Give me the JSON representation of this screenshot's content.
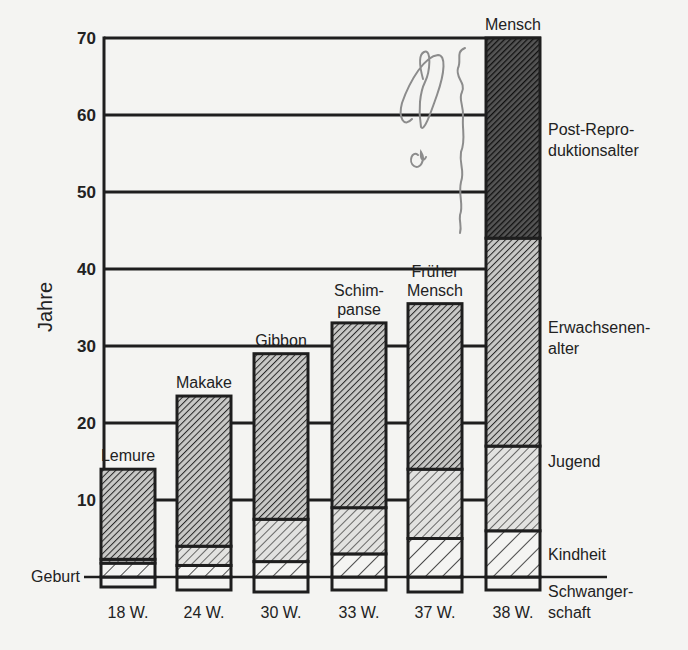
{
  "chart_data": {
    "type": "bar",
    "stacked": true,
    "title": "",
    "xlabel": "",
    "ylabel": "Jahre",
    "ylim": [
      0,
      70
    ],
    "yticks": [
      10,
      20,
      30,
      40,
      50,
      60,
      70
    ],
    "baseline_label": "Geburt",
    "grid": true,
    "categories": [
      "Lemure",
      "Makake",
      "Gibbon",
      "Schimpanse",
      "Früher Mensch",
      "Mensch"
    ],
    "category_labels": [
      [
        "Lemure"
      ],
      [
        "Makake"
      ],
      [
        "Gibbon"
      ],
      [
        "Schim-",
        "panse"
      ],
      [
        "Früher",
        "Mensch"
      ],
      [
        "Mensch"
      ]
    ],
    "gestation_labels": [
      "18 W.",
      "24 W.",
      "30 W.",
      "33 W.",
      "37 W.",
      "38 W."
    ],
    "gestation_weeks": [
      18,
      24,
      30,
      33,
      37,
      38
    ],
    "series": [
      {
        "name": "Schwangerschaft",
        "label_lines": [
          "Schwanger-",
          "schaft"
        ],
        "values_weeks": [
          18,
          24,
          30,
          33,
          37,
          38
        ],
        "pattern": "none"
      },
      {
        "name": "Kindheit",
        "label_lines": [
          "Kindheit"
        ],
        "values": [
          1.8,
          1.5,
          2,
          3,
          5,
          6
        ],
        "pattern": "sparse"
      },
      {
        "name": "Jugend",
        "label_lines": [
          "Jugend"
        ],
        "values": [
          0.5,
          2.5,
          5.5,
          6,
          9,
          11
        ],
        "pattern": "medium"
      },
      {
        "name": "Erwachsenenalter",
        "label_lines": [
          "Erwachsenen-",
          "alter"
        ],
        "values": [
          11.7,
          19.5,
          21.5,
          24,
          21.5,
          27
        ],
        "pattern": "dense"
      },
      {
        "name": "Post-Reproduktionsalter",
        "label_lines": [
          "Post-Repro-",
          "duktionsalter"
        ],
        "values": [
          0,
          0,
          0,
          0,
          0,
          26
        ],
        "pattern": "darkest"
      }
    ],
    "totals": [
      14,
      23.5,
      29,
      33,
      35.5,
      70
    ],
    "legend_position": "right"
  },
  "colors": {
    "background": "#f4f4f2",
    "ink": "#1e1e1e",
    "pencil": "#8a8a8a"
  },
  "annotations": {
    "handwritten_pencil_marks": true
  }
}
